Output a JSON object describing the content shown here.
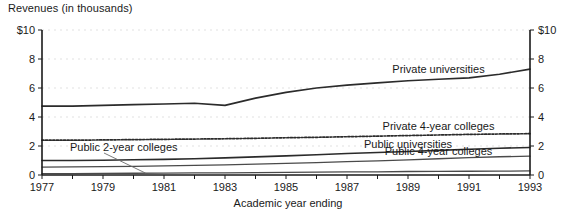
{
  "chart_data": {
    "type": "line",
    "title": "Revenues (in thousands)",
    "xlabel": "Academic year ending",
    "ylabel": "",
    "xlim": [
      1977,
      1993
    ],
    "ylim": [
      0,
      10
    ],
    "grid": true,
    "legend_position": "inline-labels",
    "x": [
      1977,
      1978,
      1979,
      1980,
      1981,
      1982,
      1983,
      1984,
      1985,
      1986,
      1987,
      1988,
      1989,
      1990,
      1991,
      1992,
      1993
    ],
    "y_ticks_left": [
      "$10",
      "8",
      "6",
      "4",
      "2",
      "0"
    ],
    "y_ticks_right": [
      "$10",
      "8",
      "6",
      "4",
      "2",
      "0"
    ],
    "y_tick_values": [
      10,
      8,
      6,
      4,
      2,
      0
    ],
    "x_ticks": [
      "1977",
      "1979",
      "1981",
      "1983",
      "1985",
      "1987",
      "1989",
      "1991",
      "1993"
    ],
    "x_tick_values": [
      1977,
      1979,
      1981,
      1983,
      1985,
      1987,
      1989,
      1991,
      1993
    ],
    "series": [
      {
        "name": "Private universities",
        "style": "solid",
        "label_x": 1990,
        "values": [
          4.75,
          4.75,
          4.8,
          4.85,
          4.9,
          4.95,
          4.8,
          5.3,
          5.7,
          6.0,
          6.2,
          6.35,
          6.5,
          6.6,
          6.7,
          6.95,
          7.3
        ]
      },
      {
        "name": "Private 4-year colleges",
        "style": "dotted",
        "label_x": 1990,
        "values": [
          2.4,
          2.4,
          2.42,
          2.44,
          2.46,
          2.48,
          2.5,
          2.53,
          2.57,
          2.6,
          2.64,
          2.68,
          2.72,
          2.76,
          2.8,
          2.83,
          2.85
        ]
      },
      {
        "name": "Public universities",
        "style": "solid",
        "label_x": 1989,
        "values": [
          1.0,
          1.0,
          1.02,
          1.05,
          1.08,
          1.12,
          1.18,
          1.25,
          1.32,
          1.4,
          1.48,
          1.55,
          1.62,
          1.7,
          1.78,
          1.85,
          1.9
        ]
      },
      {
        "name": "Public 4-year colleges",
        "style": "thin",
        "label_x": 1990,
        "values": [
          0.55,
          0.56,
          0.58,
          0.6,
          0.63,
          0.66,
          0.7,
          0.75,
          0.8,
          0.86,
          0.92,
          0.98,
          1.05,
          1.12,
          1.2,
          1.26,
          1.3
        ]
      },
      {
        "name": "Public 2-year colleges",
        "style": "thin",
        "label_x": 1980,
        "values": [
          0.1,
          0.1,
          0.11,
          0.12,
          0.13,
          0.14,
          0.15,
          0.17,
          0.18,
          0.2,
          0.21,
          0.22,
          0.24,
          0.25,
          0.26,
          0.27,
          0.28
        ]
      }
    ],
    "annotations": [
      {
        "text": "Public 2-year colleges",
        "kind": "callout-with-leader",
        "leader_target_year": 1980.4
      }
    ],
    "colors": {
      "line": "#2b2b2b",
      "thin_line": "#4a4a4a",
      "grid": "#d9d9d9",
      "axis": "#1a1a1a",
      "background": "#ffffff"
    }
  }
}
